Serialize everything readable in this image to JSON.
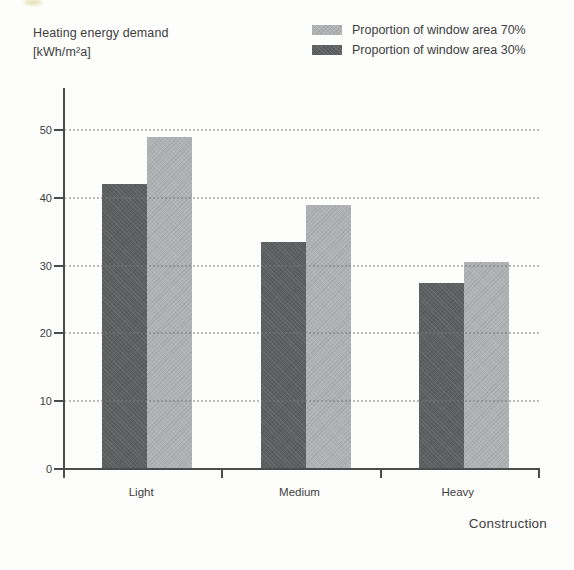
{
  "figure": {
    "title_line1": "Heating energy demand",
    "title_line2": "[kWh/m²a]"
  },
  "legend": {
    "items": [
      {
        "label": "Proportion of window area 70%",
        "color": "#b0b2b4"
      },
      {
        "label": "Proportion of window area 30%",
        "color": "#5d5f61"
      }
    ]
  },
  "chart_data": {
    "type": "bar",
    "title": "Heating energy demand [kWh/m²a]",
    "categories": [
      "Light",
      "Medium",
      "Heavy"
    ],
    "series": [
      {
        "name": "Proportion of window area 30%",
        "color": "#5d5f61",
        "values": [
          42,
          33.5,
          27.5
        ]
      },
      {
        "name": "Proportion of window area 70%",
        "color": "#b0b2b4",
        "values": [
          49,
          39,
          30.5
        ]
      }
    ],
    "xlabel": "Construction",
    "ylabel_line1": "Heating energy demand",
    "ylabel_line2": "[kWh/m²a]",
    "ylim": [
      0,
      50
    ],
    "yticks": [
      0,
      10,
      20,
      30,
      40,
      50
    ],
    "grid": "horizontal-dotted",
    "legend_position": "top-right"
  },
  "colors": {
    "text": "#3d3e40",
    "axis": "#4b4c4e",
    "gridline": "#787878",
    "background": "#fdfdfb",
    "bar_dark": "#5d5f61",
    "bar_light": "#b0b2b4"
  }
}
